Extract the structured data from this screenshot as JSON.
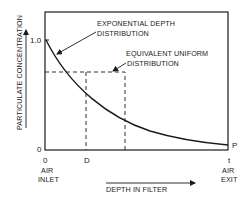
{
  "diagram": {
    "type": "concentration-vs-depth",
    "y_axis": {
      "label": "PARTICULATE CONCENTRATION",
      "ticks": [
        "1.0",
        "0"
      ]
    },
    "x_axis": {
      "label": "DEPTH IN FILTER",
      "ticks": {
        "start": "0",
        "mid": "D",
        "end": "t"
      },
      "start_caption": [
        "AIR",
        "INLET"
      ],
      "end_caption": [
        "AIR",
        "EXIT"
      ]
    },
    "curves": {
      "exponential": {
        "label_line1": "EXPONENTIAL DEPTH",
        "label_line2": "DISTRIBUTION"
      },
      "uniform": {
        "label_line1": "EQUIVALENT UNIFORM",
        "label_line2": "DISTRIBUTION"
      }
    },
    "end_point_label": "P",
    "colors": {
      "ink": "#1a1a1a",
      "background": "#ffffff"
    }
  }
}
